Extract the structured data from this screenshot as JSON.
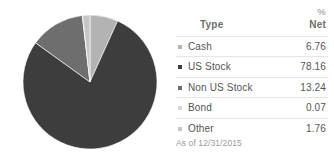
{
  "chart_data": {
    "type": "pie",
    "title": "",
    "legend_position": "right",
    "categories": [
      "Cash",
      "US Stock",
      "Non US Stock",
      "Bond",
      "Other"
    ],
    "values": [
      6.76,
      78.16,
      13.24,
      0.07,
      1.76
    ],
    "unit": "%",
    "slice_colors": [
      "#b3b3b3",
      "#3d3d3d",
      "#6e6e6e",
      "#d6d6d6",
      "#c6c6c6"
    ],
    "start_angle_deg": 0,
    "direction": "clockwise",
    "series": [
      {
        "name": "Net %",
        "values": [
          6.76,
          78.16,
          13.24,
          0.07,
          1.76
        ]
      }
    ]
  },
  "legend": {
    "header": {
      "percent_symbol": "%",
      "type_label": "Type",
      "net_label": "Net"
    },
    "rows": [
      {
        "marker": "swatch-cash",
        "name": "Cash",
        "value": "6.76"
      },
      {
        "marker": "swatch-us-stock",
        "name": "US Stock",
        "value": "78.16"
      },
      {
        "marker": "swatch-non-us-stock",
        "name": "Non US Stock",
        "value": "13.24"
      },
      {
        "marker": "swatch-bond",
        "name": "Bond",
        "value": "0.07"
      },
      {
        "marker": "swatch-other",
        "name": "Other",
        "value": "1.76"
      }
    ],
    "footer": "As of 12/31/2015"
  },
  "colors": {
    "cash": "#b3b3b3",
    "us_stock": "#3d3d3d",
    "non_us_stock": "#6e6e6e",
    "bond": "#d6d6d6",
    "other": "#c6c6c6",
    "text": "#555555",
    "header_text": "#6e6e6e",
    "muted_text": "#9a9a9a",
    "rule": "#e6e6e6",
    "background": "#ffffff"
  }
}
